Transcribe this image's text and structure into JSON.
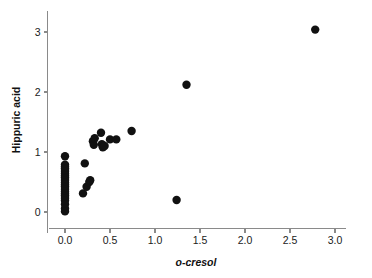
{
  "chart_data": {
    "type": "scatter",
    "title": "",
    "xlabel": "o-cresol",
    "ylabel": "Hippuric acid",
    "xlim": [
      -0.18,
      3.12
    ],
    "ylim": [
      -0.35,
      3.35
    ],
    "grid": false,
    "legend": null,
    "xticks": [
      0.0,
      0.5,
      1.0,
      1.5,
      2.0,
      2.5,
      3.0
    ],
    "xticklabels": [
      "0.0",
      "0.5",
      "1.0",
      "1.5",
      "2.0",
      "2.5",
      "3.0"
    ],
    "yticks": [
      0,
      1,
      2,
      3
    ],
    "yticklabels": [
      "0",
      "1",
      "2",
      "3"
    ],
    "marker": "filled-circle",
    "marker_color": "#111111",
    "marker_size": 4.2,
    "points": [
      {
        "x": 0.0,
        "y": 0.93
      },
      {
        "x": 0.0,
        "y": 0.79
      },
      {
        "x": 0.0,
        "y": 0.76
      },
      {
        "x": 0.0,
        "y": 0.73
      },
      {
        "x": 0.0,
        "y": 0.7
      },
      {
        "x": 0.0,
        "y": 0.67
      },
      {
        "x": 0.0,
        "y": 0.64
      },
      {
        "x": 0.0,
        "y": 0.61
      },
      {
        "x": 0.0,
        "y": 0.58
      },
      {
        "x": 0.0,
        "y": 0.55
      },
      {
        "x": 0.0,
        "y": 0.52
      },
      {
        "x": 0.0,
        "y": 0.49
      },
      {
        "x": 0.0,
        "y": 0.46
      },
      {
        "x": 0.0,
        "y": 0.43
      },
      {
        "x": 0.0,
        "y": 0.4
      },
      {
        "x": 0.0,
        "y": 0.37
      },
      {
        "x": 0.0,
        "y": 0.34
      },
      {
        "x": 0.0,
        "y": 0.31
      },
      {
        "x": 0.0,
        "y": 0.28
      },
      {
        "x": 0.0,
        "y": 0.25
      },
      {
        "x": 0.0,
        "y": 0.22
      },
      {
        "x": 0.0,
        "y": 0.19
      },
      {
        "x": 0.0,
        "y": 0.13
      },
      {
        "x": 0.0,
        "y": 0.06
      },
      {
        "x": 0.0,
        "y": 0.01
      },
      {
        "x": 0.2,
        "y": 0.31
      },
      {
        "x": 0.22,
        "y": 0.81
      },
      {
        "x": 0.24,
        "y": 0.42
      },
      {
        "x": 0.27,
        "y": 0.5
      },
      {
        "x": 0.28,
        "y": 0.53
      },
      {
        "x": 0.31,
        "y": 1.18
      },
      {
        "x": 0.32,
        "y": 1.12
      },
      {
        "x": 0.33,
        "y": 1.23
      },
      {
        "x": 0.4,
        "y": 1.32
      },
      {
        "x": 0.41,
        "y": 1.13
      },
      {
        "x": 0.42,
        "y": 1.08
      },
      {
        "x": 0.44,
        "y": 1.1
      },
      {
        "x": 0.5,
        "y": 1.21
      },
      {
        "x": 0.57,
        "y": 1.21
      },
      {
        "x": 0.74,
        "y": 1.35
      },
      {
        "x": 1.24,
        "y": 0.2
      },
      {
        "x": 1.35,
        "y": 2.12
      },
      {
        "x": 2.78,
        "y": 3.04
      }
    ]
  }
}
